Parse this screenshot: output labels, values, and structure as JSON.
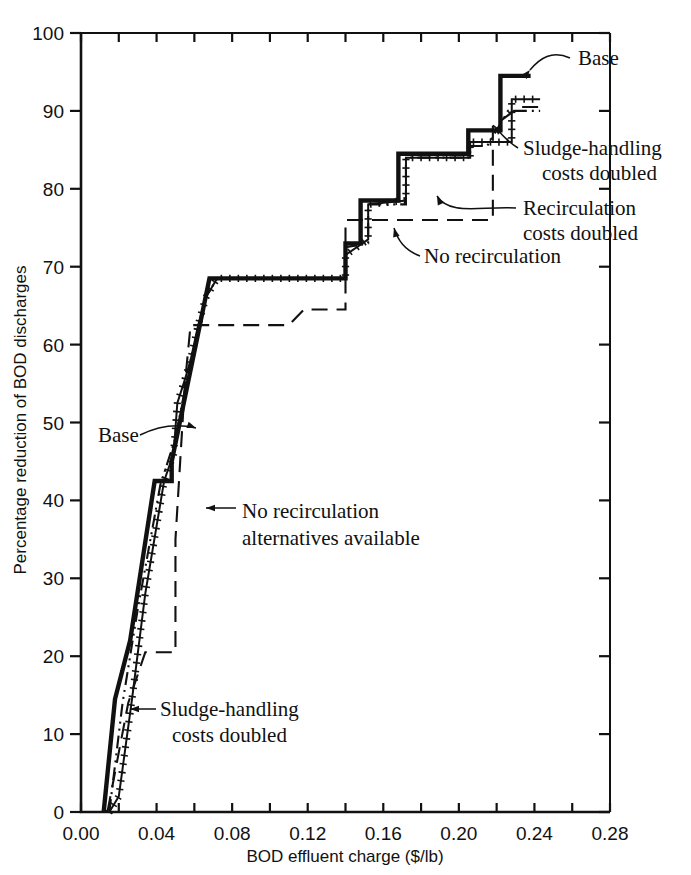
{
  "chart_data": {
    "type": "line",
    "title": "",
    "xlabel": "BOD effluent charge ($/lb)",
    "ylabel": "Percentage reduction of BOD discharges",
    "xlim": [
      0.0,
      0.28
    ],
    "ylim": [
      0,
      100
    ],
    "grid": false,
    "legend_position": "inline-annotations",
    "xticks": [
      "0.00",
      "0.04",
      "0.08",
      "0.12",
      "0.16",
      "0.20",
      "0.24",
      "0.28"
    ],
    "xtick_values": [
      0.0,
      0.04,
      0.08,
      0.12,
      0.16,
      0.2,
      0.24,
      0.28
    ],
    "xminor_step": 0.02,
    "yticks": [
      "0",
      "10",
      "20",
      "30",
      "40",
      "50",
      "60",
      "70",
      "80",
      "90",
      "100"
    ],
    "ytick_values": [
      0,
      10,
      20,
      30,
      40,
      50,
      60,
      70,
      80,
      90,
      100
    ],
    "series": [
      {
        "name": "Base",
        "style": "thick-solid",
        "points": [
          [
            0.012,
            0.0
          ],
          [
            0.018,
            14.5
          ],
          [
            0.026,
            22.0
          ],
          [
            0.039,
            42.5
          ],
          [
            0.048,
            42.5
          ],
          [
            0.048,
            45.0
          ],
          [
            0.068,
            68.5
          ],
          [
            0.14,
            68.5
          ],
          [
            0.14,
            73.0
          ],
          [
            0.148,
            73.0
          ],
          [
            0.148,
            78.5
          ],
          [
            0.168,
            78.5
          ],
          [
            0.168,
            84.5
          ],
          [
            0.205,
            84.5
          ],
          [
            0.205,
            87.5
          ],
          [
            0.222,
            87.5
          ],
          [
            0.222,
            94.5
          ],
          [
            0.238,
            94.5
          ]
        ]
      },
      {
        "name": "Sludge-handling costs doubled",
        "style": "cross-hatched",
        "points": [
          [
            0.015,
            0.0
          ],
          [
            0.02,
            2.0
          ],
          [
            0.027,
            14.5
          ],
          [
            0.034,
            28.0
          ],
          [
            0.044,
            42.5
          ],
          [
            0.049,
            46.0
          ],
          [
            0.051,
            52.5
          ],
          [
            0.055,
            55.5
          ],
          [
            0.058,
            58.0
          ],
          [
            0.062,
            62.5
          ],
          [
            0.066,
            66.0
          ],
          [
            0.072,
            68.5
          ],
          [
            0.14,
            68.5
          ],
          [
            0.14,
            71.5
          ],
          [
            0.152,
            73.5
          ],
          [
            0.152,
            78.0
          ],
          [
            0.172,
            78.5
          ],
          [
            0.172,
            84.0
          ],
          [
            0.206,
            84.0
          ],
          [
            0.206,
            86.0
          ],
          [
            0.228,
            86.0
          ],
          [
            0.228,
            91.5
          ],
          [
            0.243,
            91.5
          ]
        ]
      },
      {
        "name": "Recirculation costs doubled",
        "style": "dash-dot-dot",
        "points": [
          [
            0.015,
            0.0
          ],
          [
            0.022,
            14.0
          ],
          [
            0.03,
            26.0
          ],
          [
            0.042,
            42.0
          ],
          [
            0.05,
            48.0
          ],
          [
            0.058,
            58.0
          ],
          [
            0.066,
            66.0
          ],
          [
            0.072,
            68.5
          ],
          [
            0.098,
            68.5
          ],
          [
            0.14,
            68.5
          ],
          [
            0.14,
            72.5
          ],
          [
            0.152,
            73.0
          ],
          [
            0.152,
            78.0
          ],
          [
            0.172,
            78.0
          ],
          [
            0.172,
            84.0
          ],
          [
            0.206,
            84.0
          ],
          [
            0.206,
            85.5
          ],
          [
            0.215,
            85.5
          ],
          [
            0.226,
            90.0
          ],
          [
            0.243,
            90.0
          ]
        ]
      },
      {
        "name": "No recirculation",
        "style": "long-dash",
        "points": [
          [
            0.014,
            0.0
          ],
          [
            0.025,
            14.0
          ],
          [
            0.034,
            20.5
          ],
          [
            0.05,
            20.5
          ],
          [
            0.05,
            35.0
          ],
          [
            0.055,
            55.0
          ],
          [
            0.058,
            62.5
          ],
          [
            0.072,
            62.5
          ],
          [
            0.11,
            62.5
          ],
          [
            0.118,
            64.5
          ],
          [
            0.14,
            64.5
          ],
          [
            0.14,
            76.0
          ],
          [
            0.175,
            76.0
          ],
          [
            0.205,
            76.0
          ],
          [
            0.218,
            76.0
          ],
          [
            0.218,
            88.0
          ],
          [
            0.232,
            90.5
          ],
          [
            0.243,
            90.5
          ]
        ]
      }
    ],
    "annotations": [
      {
        "key": "base_right",
        "text": "Base"
      },
      {
        "key": "sludge_right",
        "text_line1": "Sludge-handling",
        "text_line2": "costs doubled"
      },
      {
        "key": "recirc_right",
        "text_line1": "Recirculation",
        "text_line2": "costs doubled"
      },
      {
        "key": "no_recirc_mid",
        "text": "No recirculation"
      },
      {
        "key": "no_recirc_alts",
        "text_line1": "No recirculation",
        "text_line2": "alternatives available"
      },
      {
        "key": "base_left",
        "text": "Base"
      },
      {
        "key": "sludge_left",
        "text_line1": "Sludge-handling",
        "text_line2": "costs doubled"
      }
    ]
  }
}
